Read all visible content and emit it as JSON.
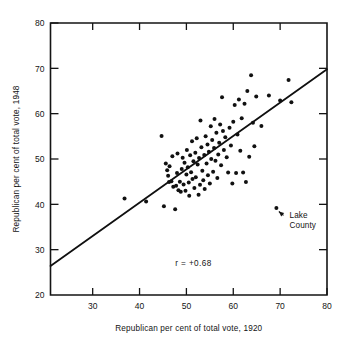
{
  "chart_data": {
    "type": "scatter",
    "title": "",
    "subtitle": "",
    "xlabel": "Republican per cent of total vote, 1920",
    "ylabel": "Republican per cent of total vote, 1948",
    "xlim": [
      21,
      80
    ],
    "ylim": [
      20,
      80
    ],
    "xticks": [
      30,
      40,
      50,
      60,
      70,
      80
    ],
    "yticks": [
      20,
      30,
      40,
      50,
      60,
      70,
      80
    ],
    "xtick_labels": [
      "30",
      "40",
      "50",
      "60",
      "70",
      "80"
    ],
    "ytick_labels": [
      "20",
      "30",
      "40",
      "50",
      "60",
      "70",
      "80"
    ],
    "grid": false,
    "legend": false,
    "legend_position": "none",
    "annotations": [
      {
        "name": "correlation",
        "text": "r = +0.68",
        "x": 51.5,
        "y": 26.5
      },
      {
        "name": "lake-county",
        "text_line1": "Lake",
        "text_line2": "County",
        "point_x": 69.2,
        "point_y": 39.2,
        "label_x": 72.0,
        "label_y": 37.0
      }
    ],
    "fit_line": {
      "name": "least-squares-regression-line",
      "x1": 21.0,
      "y1": 26.4,
      "x2": 80.0,
      "y2": 69.8,
      "color": "#101010"
    },
    "point_color": "#111111",
    "point_size": 2.0,
    "series": [
      {
        "name": "Counties",
        "points": [
          [
            36.8,
            41.3
          ],
          [
            41.4,
            40.6
          ],
          [
            44.7,
            55.1
          ],
          [
            45.2,
            39.6
          ],
          [
            45.6,
            49.0
          ],
          [
            45.9,
            47.5
          ],
          [
            46.1,
            46.3
          ],
          [
            46.4,
            48.4
          ],
          [
            46.3,
            44.9
          ],
          [
            46.8,
            45.1
          ],
          [
            47.0,
            50.6
          ],
          [
            47.2,
            43.9
          ],
          [
            47.6,
            38.9
          ],
          [
            47.8,
            44.1
          ],
          [
            48.0,
            46.9
          ],
          [
            48.1,
            51.2
          ],
          [
            48.3,
            43.1
          ],
          [
            48.6,
            45.0
          ],
          [
            48.8,
            42.8
          ],
          [
            49.0,
            47.8
          ],
          [
            49.2,
            50.3
          ],
          [
            49.4,
            44.4
          ],
          [
            49.6,
            49.2
          ],
          [
            49.8,
            43.0
          ],
          [
            50.0,
            46.6
          ],
          [
            50.1,
            52.0
          ],
          [
            50.3,
            48.2
          ],
          [
            50.5,
            44.8
          ],
          [
            50.6,
            41.9
          ],
          [
            50.8,
            50.8
          ],
          [
            51.0,
            47.1
          ],
          [
            51.2,
            53.9
          ],
          [
            51.3,
            45.6
          ],
          [
            51.5,
            49.5
          ],
          [
            51.7,
            43.6
          ],
          [
            51.9,
            51.4
          ],
          [
            52.0,
            46.0
          ],
          [
            52.2,
            54.6
          ],
          [
            52.4,
            48.8
          ],
          [
            52.6,
            42.1
          ],
          [
            52.7,
            50.2
          ],
          [
            52.9,
            44.3
          ],
          [
            53.0,
            58.5
          ],
          [
            53.2,
            52.6
          ],
          [
            53.4,
            47.4
          ],
          [
            53.6,
            45.3
          ],
          [
            53.8,
            50.9
          ],
          [
            53.9,
            43.4
          ],
          [
            54.1,
            55.0
          ],
          [
            54.3,
            49.0
          ],
          [
            54.5,
            53.2
          ],
          [
            54.6,
            46.4
          ],
          [
            54.8,
            51.6
          ],
          [
            55.0,
            44.6
          ],
          [
            55.2,
            57.2
          ],
          [
            55.3,
            50.0
          ],
          [
            55.5,
            54.2
          ],
          [
            55.7,
            47.2
          ],
          [
            55.9,
            52.4
          ],
          [
            56.0,
            58.8
          ],
          [
            56.2,
            49.6
          ],
          [
            56.4,
            55.8
          ],
          [
            56.6,
            45.8
          ],
          [
            56.8,
            51.0
          ],
          [
            57.0,
            53.6
          ],
          [
            57.2,
            57.6
          ],
          [
            57.4,
            48.6
          ],
          [
            57.6,
            63.6
          ],
          [
            57.8,
            56.2
          ],
          [
            58.0,
            52.0
          ],
          [
            58.3,
            54.8
          ],
          [
            58.6,
            50.4
          ],
          [
            58.9,
            47.0
          ],
          [
            59.2,
            56.9
          ],
          [
            59.5,
            53.0
          ],
          [
            59.8,
            44.6
          ],
          [
            60.0,
            58.2
          ],
          [
            60.3,
            61.9
          ],
          [
            60.6,
            46.9
          ],
          [
            60.9,
            55.4
          ],
          [
            61.2,
            63.1
          ],
          [
            61.5,
            51.8
          ],
          [
            61.8,
            59.0
          ],
          [
            62.1,
            47.0
          ],
          [
            62.4,
            62.2
          ],
          [
            62.7,
            44.9
          ],
          [
            63.0,
            65.0
          ],
          [
            63.4,
            50.5
          ],
          [
            63.8,
            68.5
          ],
          [
            64.2,
            58.0
          ],
          [
            64.5,
            52.8
          ],
          [
            64.9,
            63.8
          ],
          [
            66.0,
            57.3
          ],
          [
            67.6,
            64.0
          ],
          [
            69.2,
            39.2
          ],
          [
            70.0,
            62.9
          ],
          [
            71.8,
            67.4
          ],
          [
            72.4,
            62.5
          ]
        ]
      }
    ]
  }
}
